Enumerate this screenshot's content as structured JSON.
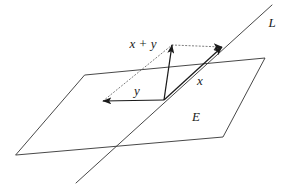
{
  "figure": {
    "background_color": "#ffffff",
    "stroke_color": "#333333",
    "vector_color": "#1a1a1a",
    "dotted_color": "#666666",
    "width": 284,
    "height": 188
  },
  "labels": {
    "sum_vector": "x + y",
    "vector_x": "x",
    "vector_y": "y",
    "plane": "E",
    "line": "L"
  },
  "label_positions": {
    "sum_vector": {
      "x": 143,
      "y": 45
    },
    "vector_x": {
      "x": 200,
      "y": 82
    },
    "vector_y": {
      "x": 137,
      "y": 92
    },
    "plane": {
      "x": 196,
      "y": 118
    },
    "line": {
      "x": 272,
      "y": 24
    }
  },
  "geometry": {
    "plane_E": {
      "type": "parallelogram",
      "points": "85,75 265,58 223,137 16,155"
    },
    "line_L": {
      "type": "segment",
      "x1": 76,
      "y1": 183,
      "x2": 272,
      "y2": 5
    },
    "origin": {
      "x": 164,
      "y": 100
    },
    "vectors": [
      {
        "name": "y",
        "tip_x": 103,
        "tip_y": 101
      },
      {
        "name": "x",
        "tip_x": 222,
        "tip_y": 47
      },
      {
        "name": "x + y",
        "tip_x": 172,
        "tip_y": 45
      }
    ],
    "dotted_edges": [
      {
        "name": "y-to-sum",
        "x1": 103,
        "y1": 101,
        "x2": 172,
        "y2": 45
      },
      {
        "name": "sum-to-x",
        "x1": 172,
        "y1": 45,
        "x2": 222,
        "y2": 47
      }
    ]
  }
}
